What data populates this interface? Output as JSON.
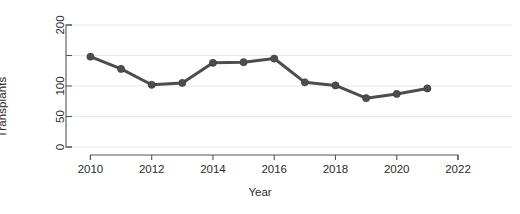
{
  "chart_data": {
    "type": "line",
    "title": "",
    "xlabel": "Year",
    "ylabel": "Transplants",
    "x": [
      2010,
      2011,
      2012,
      2013,
      2014,
      2015,
      2016,
      2017,
      2018,
      2019,
      2020,
      2021
    ],
    "values": [
      148,
      128,
      102,
      105,
      138,
      139,
      145,
      106,
      101,
      80,
      87,
      96
    ],
    "series": [
      {
        "name": "Transplants",
        "values": [
          148,
          128,
          102,
          105,
          138,
          139,
          145,
          106,
          101,
          80,
          87,
          96
        ]
      }
    ],
    "xlim": [
      2009.3,
      2022.0
    ],
    "ylim": [
      0,
      200
    ],
    "xticks": [
      2010,
      2012,
      2014,
      2016,
      2018,
      2020,
      2022
    ],
    "xtick_labels": [
      "2010",
      "2012",
      "2014",
      "2016",
      "2018",
      "2020",
      "2022"
    ],
    "yticks": [
      0,
      50,
      100,
      150,
      200
    ],
    "ytick_labels": [
      "0",
      "50",
      "100",
      "",
      "200"
    ],
    "grid": true,
    "legend": null,
    "marker": "circle",
    "line_color": "#4d4d4d",
    "marker_color": "#4d4d4d",
    "grid_color": "#e2e2e2",
    "axis_color": "#555555",
    "background": "#ffffff"
  }
}
